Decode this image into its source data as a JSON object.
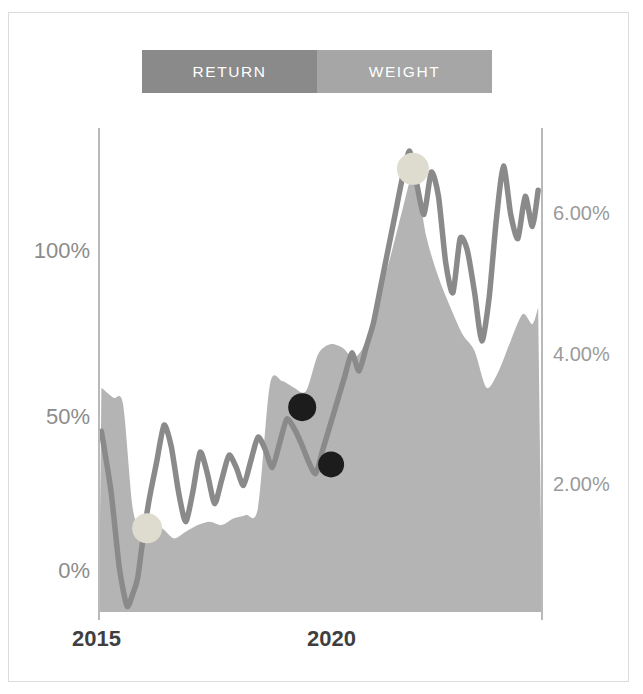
{
  "legend": {
    "tabs": [
      {
        "label": "RETURN",
        "color": "#8a8a8a",
        "name": "tab-return"
      },
      {
        "label": "WEIGHT",
        "color": "#a6a6a6",
        "name": "tab-weight"
      }
    ]
  },
  "axes": {
    "left_ticks": [
      {
        "label": "100%",
        "y": 253
      },
      {
        "label": "50%",
        "y": 419
      },
      {
        "label": "0%",
        "y": 573
      }
    ],
    "right_ticks": [
      {
        "label": "6.00%",
        "y": 216
      },
      {
        "label": "4.00%",
        "y": 357
      },
      {
        "label": "2.00%",
        "y": 487
      }
    ],
    "x_ticks": [
      {
        "label": "2015",
        "x": 100
      },
      {
        "label": "2020",
        "x": 335
      }
    ]
  },
  "chart_data": {
    "type": "line",
    "title": "",
    "xlabel": "",
    "ylabel": "",
    "y_left_label": "Return",
    "y_right_label": "Weight",
    "grid": false,
    "legend_position": "top",
    "xlim": [
      2014.2,
      2023.4
    ],
    "ylim_left": [
      -20,
      140
    ],
    "ylim_right": [
      0.0,
      7.2
    ],
    "x_tick_values": [
      2015,
      2020
    ],
    "y_left_tick_values": [
      0,
      50,
      100
    ],
    "y_left_tick_labels": [
      "0%",
      "50%",
      "100%"
    ],
    "y_right_tick_values": [
      2.0,
      4.0,
      6.0
    ],
    "y_right_tick_labels": [
      "2.00%",
      "4.00%",
      "6.00%"
    ],
    "series": [
      {
        "name": "RETURN",
        "axis": "left",
        "type": "line",
        "color": "#8a8a8a",
        "x": [
          2014.25,
          2014.45,
          2014.62,
          2014.78,
          2014.9,
          2015.0,
          2015.12,
          2015.25,
          2015.4,
          2015.55,
          2015.7,
          2015.85,
          2016.0,
          2016.15,
          2016.3,
          2016.45,
          2016.6,
          2016.75,
          2016.9,
          2017.05,
          2017.2,
          2017.35,
          2017.5,
          2017.65,
          2017.8,
          2017.95,
          2018.1,
          2018.25,
          2018.4,
          2018.55,
          2018.7,
          2018.85,
          2019.0,
          2019.15,
          2019.3,
          2019.45,
          2019.6,
          2019.75,
          2019.9,
          2020.05,
          2020.2,
          2020.35,
          2020.5,
          2020.65,
          2020.8,
          2020.95,
          2021.1,
          2021.25,
          2021.4,
          2021.55,
          2021.7,
          2021.85,
          2022.0,
          2022.15,
          2022.3,
          2022.45,
          2022.6,
          2022.75,
          2022.9,
          2023.05,
          2023.2,
          2023.32
        ],
        "y": [
          40,
          20,
          -5,
          -18,
          -14,
          -9,
          5,
          18,
          30,
          42,
          35,
          20,
          10,
          20,
          33,
          26,
          16,
          24,
          32,
          28,
          22,
          30,
          38,
          34,
          28,
          36,
          44,
          41,
          36,
          30,
          26,
          34,
          42,
          50,
          58,
          66,
          60,
          68,
          76,
          88,
          100,
          112,
          124,
          133,
          122,
          112,
          126,
          118,
          96,
          86,
          104,
          100,
          86,
          70,
          84,
          110,
          128,
          112,
          104,
          118,
          108,
          120
        ]
      },
      {
        "name": "WEIGHT",
        "axis": "right",
        "type": "area",
        "color": "#b4b4b4",
        "x": [
          2014.25,
          2014.5,
          2014.7,
          2014.9,
          2015.1,
          2015.3,
          2015.5,
          2015.75,
          2016.0,
          2016.25,
          2016.5,
          2016.75,
          2017.0,
          2017.25,
          2017.5,
          2017.75,
          2018.0,
          2018.25,
          2018.5,
          2018.75,
          2019.0,
          2019.25,
          2019.5,
          2019.75,
          2020.0,
          2020.25,
          2020.5,
          2020.75,
          2021.0,
          2021.25,
          2021.5,
          2021.75,
          2022.0,
          2022.25,
          2022.5,
          2022.75,
          2023.0,
          2023.2,
          2023.32
        ],
        "y": [
          3.35,
          3.2,
          3.1,
          1.55,
          1.2,
          1.15,
          1.25,
          1.1,
          1.2,
          1.3,
          1.35,
          1.3,
          1.4,
          1.45,
          1.55,
          3.4,
          3.45,
          3.35,
          3.3,
          3.85,
          4.0,
          3.95,
          3.8,
          4.05,
          4.7,
          5.3,
          6.0,
          6.55,
          5.6,
          5.0,
          4.55,
          4.15,
          3.9,
          3.35,
          3.6,
          4.05,
          4.45,
          4.3,
          4.55
        ]
      }
    ],
    "markers": [
      {
        "name": "weight-marker-start",
        "x": 2015.2,
        "y": 1.25,
        "axis": "right",
        "color": "#dedcce",
        "radius": 15
      },
      {
        "name": "weight-marker-peak",
        "x": 2020.72,
        "y": 6.62,
        "axis": "right",
        "color": "#dedcce",
        "radius": 16
      },
      {
        "name": "return-marker-upper",
        "x": 2018.42,
        "y": 48,
        "axis": "left",
        "color": "#1c1c1c",
        "radius": 14
      },
      {
        "name": "return-marker-lower",
        "x": 2019.02,
        "y": 29,
        "axis": "left",
        "color": "#1c1c1c",
        "radius": 13
      }
    ]
  },
  "colors": {
    "return_line": "#8a8a8a",
    "weight_area": "#b4b4b4",
    "marker_light": "#dedcce",
    "marker_dark": "#1c1c1c",
    "axis_line": "#b9b9b9",
    "frame": "#dcdcdc",
    "tick_left": "#8c8c8c",
    "tick_right": "#9a9a9a",
    "tick_x": "#3f3f3f"
  }
}
